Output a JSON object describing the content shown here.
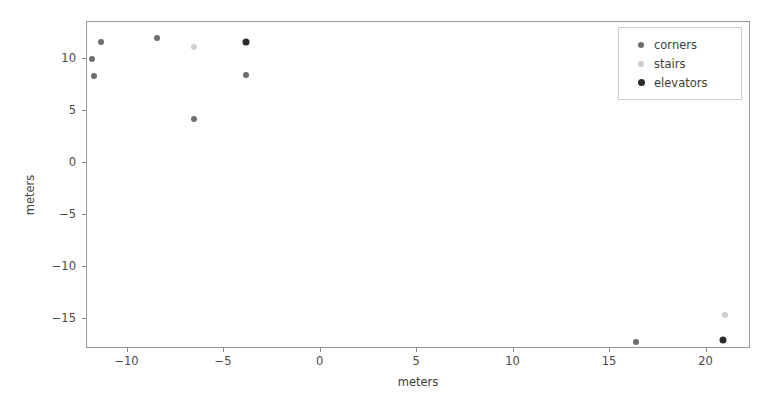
{
  "chart_data": {
    "type": "scatter",
    "title": "",
    "xlabel": "meters",
    "ylabel": "meters",
    "xlim": [
      -12.1,
      22.3
    ],
    "ylim": [
      -17.9,
      13.6
    ],
    "xticks": [
      -10,
      -5,
      0,
      5,
      10,
      15,
      20
    ],
    "xticklabels": [
      "−10",
      "−5",
      "0",
      "5",
      "10",
      "15",
      "20"
    ],
    "yticks": [
      10,
      5,
      0,
      -5,
      -10,
      -15
    ],
    "yticklabels": [
      "10",
      "5",
      "0",
      "−5",
      "−10",
      "−15"
    ],
    "grid": false,
    "legend_position": "upper right",
    "series": [
      {
        "name": "corners",
        "color": "#6e6e6e",
        "marker": "circle",
        "marker_size": 6,
        "points": [
          {
            "x": -11.3,
            "y": 11.6
          },
          {
            "x": -11.8,
            "y": 9.9
          },
          {
            "x": -11.7,
            "y": 8.3
          },
          {
            "x": -8.4,
            "y": 12.0
          },
          {
            "x": -6.5,
            "y": 4.2
          },
          {
            "x": -3.8,
            "y": 8.4
          },
          {
            "x": 16.4,
            "y": -17.3
          }
        ]
      },
      {
        "name": "stairs",
        "color": "#cfcfcf",
        "marker": "circle",
        "marker_size": 6,
        "points": [
          {
            "x": -6.5,
            "y": 11.1
          },
          {
            "x": 21.0,
            "y": -14.7
          }
        ]
      },
      {
        "name": "elevators",
        "color": "#2b2b2b",
        "marker": "circle",
        "marker_size": 7,
        "points": [
          {
            "x": -3.8,
            "y": 11.6
          },
          {
            "x": 20.9,
            "y": -17.1
          }
        ]
      }
    ]
  },
  "legend": {
    "entries": [
      {
        "label": "corners",
        "color": "#6e6e6e",
        "size": 6
      },
      {
        "label": "stairs",
        "color": "#cfcfcf",
        "size": 6
      },
      {
        "label": "elevators",
        "color": "#2b2b2b",
        "size": 7
      }
    ]
  }
}
